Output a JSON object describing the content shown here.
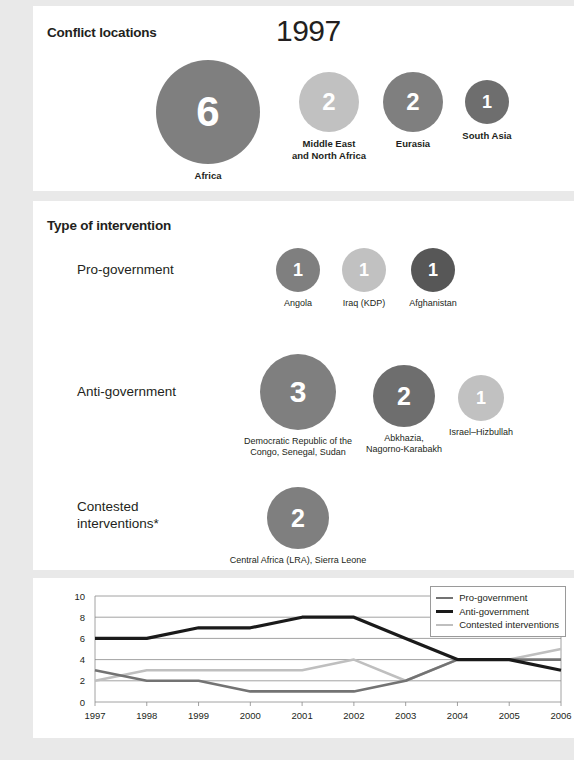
{
  "year": "1997",
  "sections": {
    "locations": {
      "title": "Conflict locations",
      "bubbles": [
        {
          "value": "6",
          "label": "Africa",
          "color": "#7f7f7f",
          "size": 104,
          "cx": 175,
          "cy": 106
        },
        {
          "value": "2",
          "label": "Middle East\nand North Africa",
          "color": "#c1c1c1",
          "size": 60,
          "cx": 296,
          "cy": 96
        },
        {
          "value": "2",
          "label": "Eurasia",
          "color": "#7f7f7f",
          "size": 60,
          "cx": 380,
          "cy": 96
        },
        {
          "value": "1",
          "label": "South Asia",
          "color": "#6e6e6e",
          "size": 44,
          "cx": 454,
          "cy": 96
        }
      ]
    },
    "intervention": {
      "title": "Type of intervention",
      "rows": [
        {
          "label": "Pro-government",
          "bubbles": [
            {
              "value": "1",
              "label": "Angola",
              "color": "#7f7f7f",
              "size": 44,
              "cx": 265,
              "cy": 69
            },
            {
              "value": "1",
              "label": "Iraq (KDP)",
              "color": "#c1c1c1",
              "size": 44,
              "cx": 331,
              "cy": 69
            },
            {
              "value": "1",
              "label": "Afghanistan",
              "color": "#575757",
              "size": 44,
              "cx": 400,
              "cy": 69
            }
          ]
        },
        {
          "label": "Anti-government",
          "bubbles": [
            {
              "value": "3",
              "label": "Democratic Republic of the\nCongo, Senegal, Sudan",
              "color": "#7f7f7f",
              "size": 76,
              "cx": 265,
              "cy": 191
            },
            {
              "value": "2",
              "label": "Abkhazia,\nNagorno-Karabakh",
              "color": "#6e6e6e",
              "size": 62,
              "cx": 371,
              "cy": 195
            },
            {
              "value": "1",
              "label": "Israel–Hizbullah",
              "color": "#c1c1c1",
              "size": 46,
              "cx": 448,
              "cy": 197
            }
          ]
        },
        {
          "label": "Contested\ninterventions*",
          "bubbles": [
            {
              "value": "2",
              "label": "Central Africa (LRA), Sierra Leone",
              "color": "#7f7f7f",
              "size": 62,
              "cx": 265,
              "cy": 317
            }
          ]
        }
      ]
    }
  },
  "chart_data": {
    "type": "line",
    "title": "",
    "xlabel": "",
    "ylabel": "",
    "x": [
      "1997",
      "1998",
      "1999",
      "2000",
      "2001",
      "2002",
      "2003",
      "2004",
      "2005",
      "2006"
    ],
    "ylim": [
      0,
      10
    ],
    "yticks": [
      "0",
      "2",
      "4",
      "6",
      "8",
      "10"
    ],
    "grid": true,
    "legend_position": "top-right",
    "series": [
      {
        "name": "Pro-government",
        "color": "#737373",
        "values": [
          3,
          2,
          2,
          1,
          1,
          1,
          2,
          4,
          4,
          4
        ]
      },
      {
        "name": "Anti-government",
        "color": "#1a1a1a",
        "values": [
          6,
          6,
          7,
          7,
          8,
          8,
          6,
          4,
          4,
          3
        ]
      },
      {
        "name": "Contested interventions",
        "color": "#bfbfbf",
        "values": [
          2,
          3,
          3,
          3,
          3,
          4,
          2,
          4,
          4,
          5
        ]
      }
    ]
  }
}
